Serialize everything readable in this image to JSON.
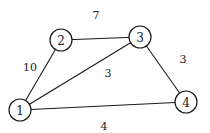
{
  "diagram": {
    "type": "weighted-undirected-graph",
    "node_radius": 11,
    "colors": {
      "stroke": "#1a1a1a",
      "node_fill": "#ffffff",
      "background": "#ffffff"
    },
    "nodes": [
      {
        "id": "1",
        "label": "1",
        "x": 20,
        "y": 110
      },
      {
        "id": "2",
        "label": "2",
        "x": 61,
        "y": 40
      },
      {
        "id": "3",
        "label": "3",
        "x": 140,
        "y": 37
      },
      {
        "id": "4",
        "label": "4",
        "x": 186,
        "y": 102
      }
    ],
    "edges": [
      {
        "from": "1",
        "to": "2",
        "weight": "10",
        "label_x": 30,
        "label_y": 67
      },
      {
        "from": "2",
        "to": "3",
        "weight": "7",
        "label_x": 96,
        "label_y": 15
      },
      {
        "from": "1",
        "to": "3",
        "weight": "3",
        "label_x": 108,
        "label_y": 73
      },
      {
        "from": "3",
        "to": "4",
        "weight": "3",
        "label_x": 183,
        "label_y": 59
      },
      {
        "from": "1",
        "to": "4",
        "weight": "4",
        "label_x": 104,
        "label_y": 126
      }
    ]
  }
}
